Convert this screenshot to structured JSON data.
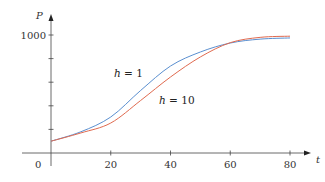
{
  "chart_data": {
    "type": "line",
    "title": "",
    "xlabel": "t",
    "ylabel": "P",
    "xlim": [
      0,
      80
    ],
    "ylim": [
      0,
      1000
    ],
    "x_ticks": [
      20,
      40,
      60,
      80
    ],
    "x_tick_labels": [
      "20",
      "40",
      "60",
      "80"
    ],
    "y_ticks": [
      200,
      400,
      600,
      800,
      1000
    ],
    "y_tick_labels": [
      "",
      "",
      "",
      "",
      "1000"
    ],
    "origin_label": "0",
    "grid": false,
    "legend": "inline labels",
    "series": [
      {
        "name": "h = 1",
        "label_var": "h",
        "label_rest": " = 1",
        "color": "#5a8fd0",
        "x": [
          0,
          10,
          20,
          30,
          40,
          50,
          60,
          70,
          80
        ],
        "values": [
          100,
          180,
          305,
          530,
          737,
          856,
          932,
          965,
          975
        ]
      },
      {
        "name": "h = 10",
        "label_var": "h",
        "label_rest": " = 10",
        "color": "#e06a4f",
        "x": [
          0,
          10,
          20,
          30,
          40,
          50,
          60,
          70,
          80
        ],
        "values": [
          100,
          170,
          254,
          445,
          644,
          814,
          935,
          980,
          990
        ]
      }
    ]
  }
}
